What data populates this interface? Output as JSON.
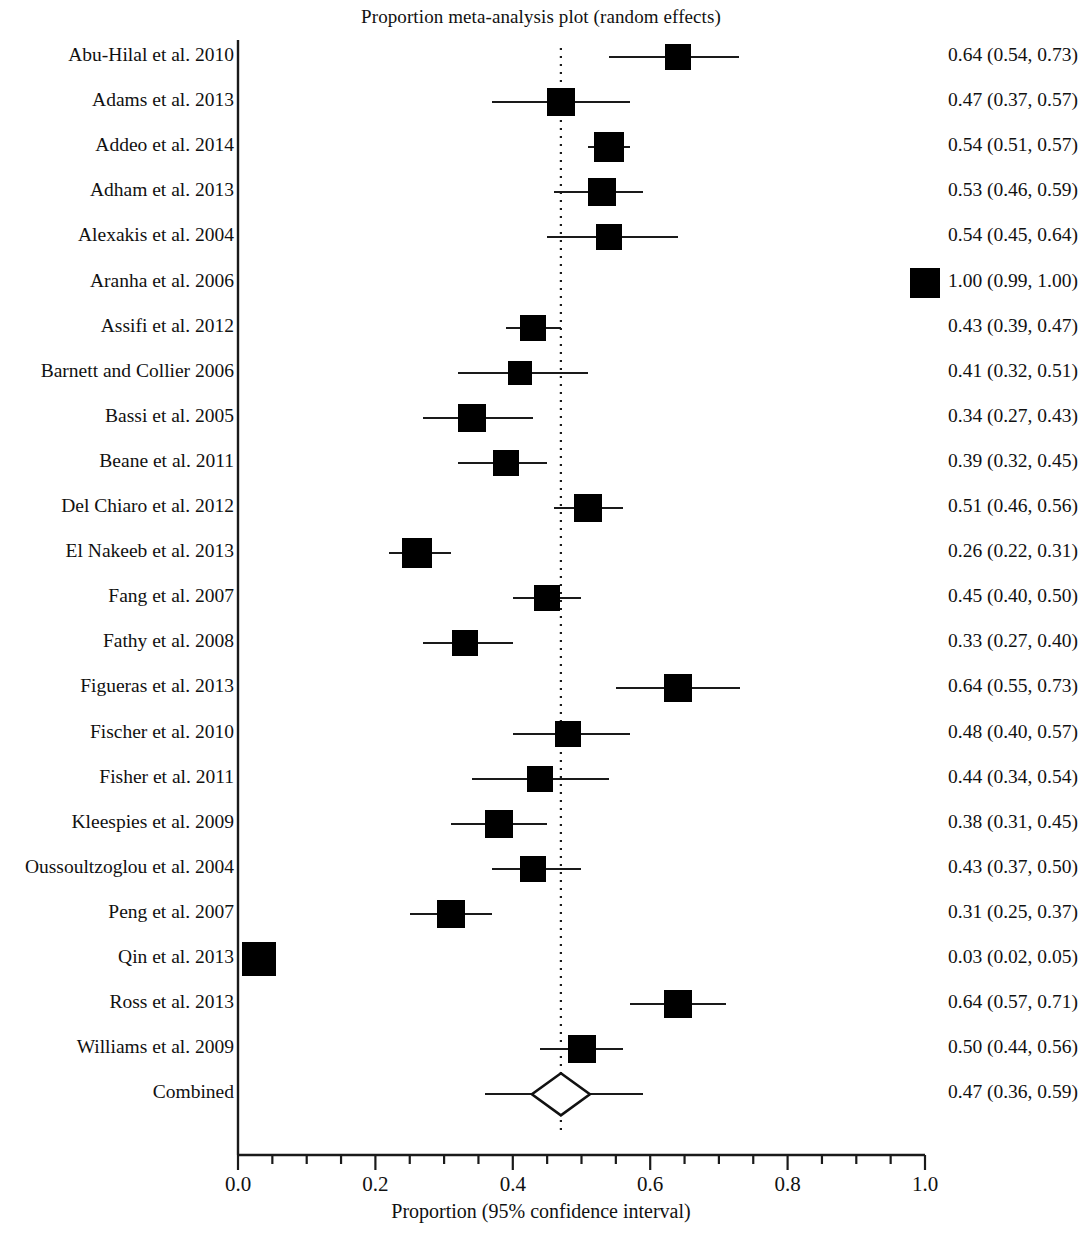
{
  "chart_data": {
    "type": "forest",
    "title": "Proportion meta-analysis plot (random effects)",
    "xlabel": "Proportion (95% confidence interval)",
    "ylabel": "",
    "xlim": [
      0.0,
      1.0
    ],
    "xticks": [
      "0.0",
      "0.2",
      "0.4",
      "0.6",
      "0.8",
      "1.0"
    ],
    "xtick_values": [
      0.0,
      0.2,
      0.4,
      0.6,
      0.8,
      1.0
    ],
    "minor_tick_step": 0.05,
    "grid": false,
    "legend": "none",
    "reference_line": 0.47,
    "reference_line_style": "dotted",
    "marker_color": "#000000",
    "axis_color": "#1a1a1a",
    "categories": [
      "Abu-Hilal et al. 2010",
      "Adams et al. 2013",
      "Addeo et al. 2014",
      "Adham et al. 2013",
      "Alexakis et al. 2004",
      "Aranha et al. 2006",
      "Assifi et al. 2012",
      "Barnett and Collier 2006",
      "Bassi et al. 2005",
      "Beane et al. 2011",
      "Del Chiaro et al. 2012",
      "El Nakeeb et al. 2013",
      "Fang et al. 2007",
      "Fathy et al. 2008",
      "Figueras et al. 2013",
      "Fischer et al. 2010",
      "Fisher et al. 2011",
      "Kleespies et al. 2009",
      "Oussoultzoglou et al. 2004",
      "Peng et al. 2007",
      "Qin et al. 2013",
      "Ross et al. 2013",
      "Williams et al. 2009",
      "Combined"
    ],
    "values": [
      0.64,
      0.47,
      0.54,
      0.53,
      0.54,
      1.0,
      0.43,
      0.41,
      0.34,
      0.39,
      0.51,
      0.26,
      0.45,
      0.33,
      0.64,
      0.48,
      0.44,
      0.38,
      0.43,
      0.31,
      0.03,
      0.64,
      0.5,
      0.47
    ],
    "ci_low": [
      0.54,
      0.37,
      0.51,
      0.46,
      0.45,
      0.99,
      0.39,
      0.32,
      0.27,
      0.32,
      0.46,
      0.22,
      0.4,
      0.27,
      0.55,
      0.4,
      0.34,
      0.31,
      0.37,
      0.25,
      0.02,
      0.57,
      0.44,
      0.36
    ],
    "ci_high": [
      0.73,
      0.57,
      0.57,
      0.59,
      0.64,
      1.0,
      0.47,
      0.51,
      0.43,
      0.45,
      0.56,
      0.31,
      0.5,
      0.4,
      0.73,
      0.57,
      0.54,
      0.45,
      0.5,
      0.37,
      0.05,
      0.71,
      0.56,
      0.59
    ],
    "weights": [
      26,
      28,
      30,
      28,
      26,
      30,
      26,
      24,
      28,
      26,
      28,
      30,
      26,
      26,
      28,
      26,
      26,
      28,
      26,
      28,
      34,
      28,
      28,
      0
    ]
  },
  "rows": [
    {
      "label": "Abu-Hilal et al. 2010",
      "value": "0.64 (0.54, 0.73)"
    },
    {
      "label": "Adams et al. 2013",
      "value": "0.47 (0.37, 0.57)"
    },
    {
      "label": "Addeo et al. 2014",
      "value": "0.54 (0.51, 0.57)"
    },
    {
      "label": "Adham et al. 2013",
      "value": "0.53 (0.46, 0.59)"
    },
    {
      "label": "Alexakis et al. 2004",
      "value": "0.54 (0.45, 0.64)"
    },
    {
      "label": "Aranha et al. 2006",
      "value": "1.00 (0.99, 1.00)"
    },
    {
      "label": "Assifi et al. 2012",
      "value": "0.43 (0.39, 0.47)"
    },
    {
      "label": "Barnett and Collier 2006",
      "value": "0.41 (0.32, 0.51)"
    },
    {
      "label": "Bassi et al. 2005",
      "value": "0.34 (0.27, 0.43)"
    },
    {
      "label": "Beane et al. 2011",
      "value": "0.39 (0.32, 0.45)"
    },
    {
      "label": "Del Chiaro et al. 2012",
      "value": "0.51 (0.46, 0.56)"
    },
    {
      "label": "El Nakeeb et al. 2013",
      "value": "0.26 (0.22, 0.31)"
    },
    {
      "label": "Fang et al. 2007",
      "value": "0.45 (0.40, 0.50)"
    },
    {
      "label": "Fathy et al. 2008",
      "value": "0.33 (0.27, 0.40)"
    },
    {
      "label": "Figueras et al. 2013",
      "value": "0.64 (0.55, 0.73)"
    },
    {
      "label": "Fischer et al. 2010",
      "value": "0.48 (0.40, 0.57)"
    },
    {
      "label": "Fisher et al. 2011",
      "value": "0.44 (0.34, 0.54)"
    },
    {
      "label": "Kleespies et al. 2009",
      "value": "0.38 (0.31, 0.45)"
    },
    {
      "label": "Oussoultzoglou et al. 2004",
      "value": "0.43 (0.37, 0.50)"
    },
    {
      "label": "Peng et al. 2007",
      "value": "0.31 (0.25, 0.37)"
    },
    {
      "label": "Qin et al. 2013",
      "value": "0.03 (0.02, 0.05)"
    },
    {
      "label": "Ross et al. 2013",
      "value": "0.64 (0.57, 0.71)"
    },
    {
      "label": "Williams et al. 2009",
      "value": "0.50 (0.44, 0.56)"
    },
    {
      "label": "Combined",
      "value": "0.47 (0.36, 0.59)"
    }
  ],
  "axis": {
    "tick_labels": [
      "0.0",
      "0.2",
      "0.4",
      "0.6",
      "0.8",
      "1.0"
    ],
    "title": "Proportion (95% confidence interval)"
  },
  "title": "Proportion meta-analysis plot (random effects)"
}
